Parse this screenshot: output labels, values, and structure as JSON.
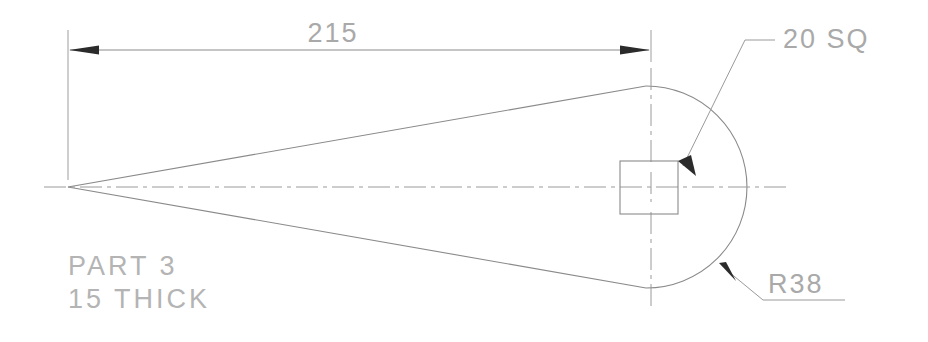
{
  "drawing": {
    "title": "Engineering Part Drawing",
    "dimensions": {
      "overall_length": {
        "value": "215",
        "label": "215",
        "type": "linear",
        "from_x": 68,
        "to_x": 651,
        "y": 50
      }
    },
    "annotations": [
      {
        "id": "square-note",
        "label": "20 SQ",
        "meaning": "20 mm square feature",
        "leader_target": "square-detail-top-right-corner"
      },
      {
        "id": "radius-note",
        "label": "R38",
        "meaning": "radius 38 mm arc",
        "leader_target": "circular-arc-lower-right"
      }
    ],
    "part_notes": {
      "line1": "PART  3",
      "line2": "15  THICK"
    },
    "colors": {
      "object_line": "#8a8a8a",
      "center_line": "#9a9a9a",
      "text": "#a9a9a9",
      "arrowhead": "#2b2b2b",
      "background": "#ffffff"
    },
    "geometry": {
      "apex": {
        "x": 68,
        "y": 187
      },
      "circle": {
        "cx": 650,
        "cy": 187,
        "r": 101
      },
      "square": {
        "x": 620,
        "y": 161,
        "w": 58,
        "h": 53
      }
    }
  }
}
